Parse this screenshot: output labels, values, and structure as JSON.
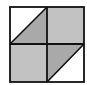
{
  "figure": {
    "outer_square": {
      "x": 10,
      "y": 7,
      "width": 74,
      "height": 75
    },
    "center": {
      "x": 47,
      "y": 44
    },
    "colors": {
      "background": "#ffffff",
      "square_fill": "#c2c2c2",
      "triangle_fill": "#a9a9a9",
      "stroke": "#111111"
    },
    "quadrants": [
      {
        "position": "top-left",
        "fill": "half",
        "white_half": "upper-left",
        "shaded_half": "lower-right",
        "diagonal": "bottom-left to top-right"
      },
      {
        "position": "top-right",
        "fill": "full"
      },
      {
        "position": "bottom-left",
        "fill": "full"
      },
      {
        "position": "bottom-right",
        "fill": "half",
        "white_half": "lower-right",
        "shaded_half": "upper-left",
        "diagonal": "bottom-left to top-right"
      }
    ]
  }
}
